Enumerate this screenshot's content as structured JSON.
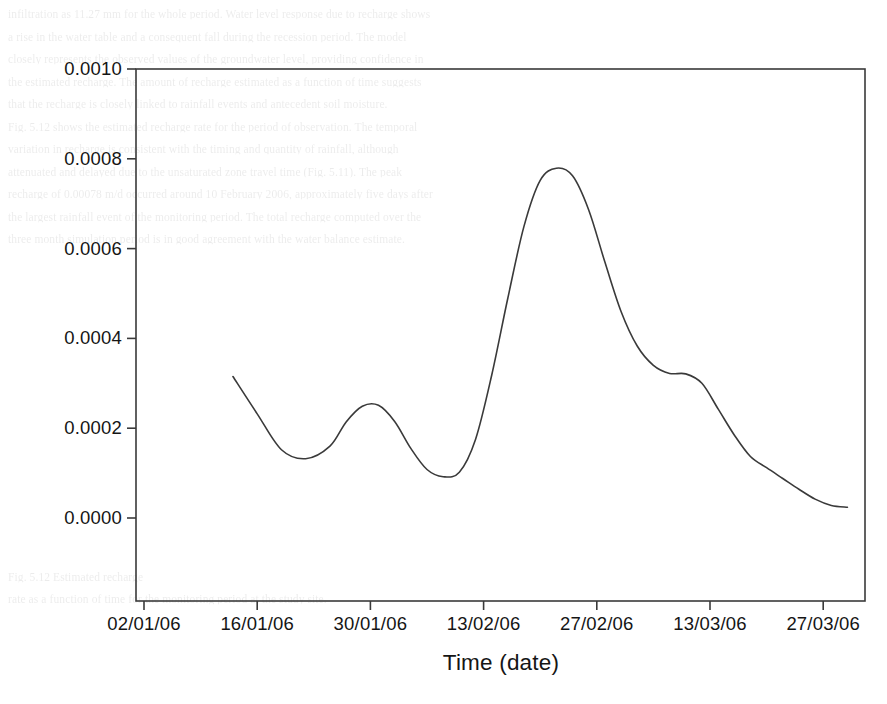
{
  "chart_data": {
    "type": "line",
    "title": "",
    "xlabel": "Time (date)",
    "ylabel": "Recharge (m/d)",
    "xticklabels": [
      "02/01/06",
      "16/01/06",
      "30/01/06",
      "13/02/06",
      "27/02/06",
      "13/03/06",
      "27/03/06"
    ],
    "yticklabels": [
      "0.0000",
      "0.0002",
      "0.0004",
      "0.0006",
      "0.0008",
      "0.0010"
    ],
    "ylim": [
      0.0,
      0.001
    ],
    "ytick_values": [
      0.0,
      0.0002,
      0.0004,
      0.0006,
      0.0008,
      0.001
    ],
    "xlim_dates": [
      "02/01/06",
      "31/03/06"
    ],
    "xtick_day_index": [
      0,
      14,
      28,
      42,
      56,
      70,
      84
    ],
    "grid": false,
    "legend": null,
    "line_color": "#3a3a3a",
    "line_width": 1.6,
    "frame_color": "#3a3a3a",
    "series": [
      {
        "name": "Recharge",
        "x_days": [
          11,
          14,
          17,
          20,
          23,
          25,
          27,
          29,
          31,
          33,
          35,
          37,
          39,
          41,
          43,
          45,
          47,
          49,
          51,
          53,
          55,
          57,
          59,
          61,
          63,
          65,
          67,
          69,
          71,
          73,
          75,
          77,
          79,
          81,
          83,
          85,
          87
        ],
        "values": [
          0.000315,
          0.000232,
          0.000152,
          0.000132,
          0.00016,
          0.000214,
          0.000249,
          0.000251,
          0.000215,
          0.000155,
          0.000108,
          9.2e-05,
          0.000102,
          0.000175,
          0.000318,
          0.00049,
          0.00065,
          0.000752,
          0.000779,
          0.000762,
          0.000686,
          0.00057,
          0.00046,
          0.000383,
          0.00034,
          0.000322,
          0.000321,
          0.0003,
          0.000243,
          0.000185,
          0.000137,
          0.000112,
          8.8e-05,
          6.4e-05,
          4.2e-05,
          2.8e-05,
          2.4e-05
        ]
      }
    ],
    "annotations": []
  },
  "axes": {
    "x_title": "Time (date)",
    "y_title": "Recharge (m/d)"
  },
  "ghost_text": {
    "lines": [
      "infiltration as 11.27 mm for the whole period. Water level response due to recharge shows",
      "a rise in the water table and a consequent fall during the recession period. The model",
      "closely represents the observed values of the groundwater level, providing confidence in",
      "the estimated recharge. The amount of recharge estimated as a function of time suggests",
      "that the recharge is closely linked to rainfall events and antecedent soil moisture.",
      "Fig. 5.12 shows the estimated recharge rate for the period of observation. The temporal",
      "variation in recharge is consistent with the timing and quantity of rainfall, although",
      "attenuated and delayed due to the unsaturated zone travel time (Fig. 5.11). The peak",
      "recharge of 0.00078 m/d occurred around 10 February 2006, approximately five days after",
      "the largest rainfall event of the monitoring period. The total recharge computed over the",
      "three month simulation period is in good agreement with the water balance estimate.",
      "",
      "",
      "",
      "",
      "",
      "",
      "",
      "",
      "",
      "",
      "",
      "",
      "",
      "",
      "Fig. 5.12 Estimated recharge",
      "rate as a function of time for the monitoring period at the study site.",
      "",
      "",
      "",
      ""
    ]
  }
}
